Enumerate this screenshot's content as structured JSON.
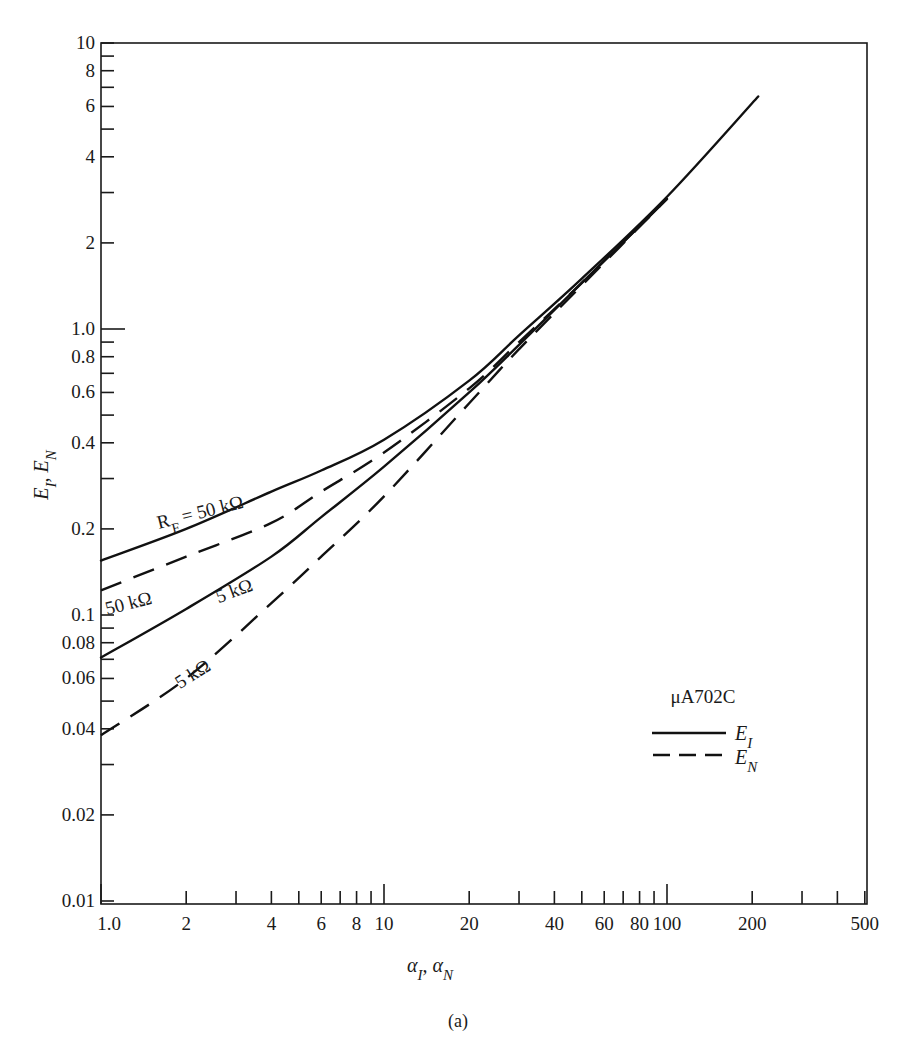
{
  "chart_data": {
    "type": "line",
    "title": "",
    "caption": "(a)",
    "xlabel": "α_I, α_N",
    "ylabel": "E_I, E_N",
    "xscale": "log",
    "yscale": "log",
    "xlim": [
      1.0,
      500
    ],
    "ylim": [
      0.01,
      10
    ],
    "grid": false,
    "legend_position": "lower-right inside plot",
    "legend_title": "μA702C",
    "legend": [
      {
        "label": "E_I",
        "style": "solid"
      },
      {
        "label": "E_N",
        "style": "dashed"
      }
    ],
    "x_ticks": {
      "labeled": [
        "1.0",
        "2",
        "4",
        "6",
        "8",
        "10",
        "20",
        "40",
        "60",
        "80",
        "100",
        "200",
        "500"
      ],
      "values": [
        1,
        2,
        3,
        4,
        5,
        6,
        7,
        8,
        9,
        10,
        20,
        30,
        40,
        50,
        60,
        70,
        80,
        90,
        100,
        200,
        300,
        400,
        500
      ]
    },
    "y_ticks": {
      "labeled": [
        "0.01",
        "0.02",
        "0.04",
        "0.06",
        "0.08",
        "0.1",
        "0.2",
        "0.4",
        "0.6",
        "0.8",
        "1.0",
        "2",
        "4",
        "6",
        "8",
        "10"
      ],
      "values": [
        0.01,
        0.02,
        0.03,
        0.04,
        0.05,
        0.06,
        0.07,
        0.08,
        0.09,
        0.1,
        0.2,
        0.3,
        0.4,
        0.5,
        0.6,
        0.7,
        0.8,
        0.9,
        1.0,
        2,
        3,
        4,
        5,
        6,
        7,
        8,
        9,
        10
      ]
    },
    "series": [
      {
        "name": "E_I, R_F = 50 kΩ",
        "style": "solid",
        "x": [
          1,
          2,
          4,
          6,
          10,
          20,
          30,
          50,
          100,
          210
        ],
        "y": [
          0.155,
          0.2,
          0.27,
          0.32,
          0.41,
          0.66,
          0.95,
          1.5,
          2.9,
          6.5
        ]
      },
      {
        "name": "E_N, R_F = 50 kΩ",
        "style": "dashed",
        "x": [
          1,
          2,
          4,
          6,
          10,
          20,
          30,
          50,
          100
        ],
        "y": [
          0.122,
          0.16,
          0.21,
          0.27,
          0.37,
          0.62,
          0.9,
          1.45,
          2.85
        ]
      },
      {
        "name": "E_I, R_F = 5 kΩ",
        "style": "solid",
        "x": [
          1,
          2,
          4,
          6,
          10,
          20,
          30,
          50,
          100
        ],
        "y": [
          0.071,
          0.105,
          0.16,
          0.22,
          0.33,
          0.6,
          0.88,
          1.45,
          2.85
        ]
      },
      {
        "name": "E_N, R_F = 5 kΩ",
        "style": "dashed",
        "x": [
          1,
          2,
          4,
          6,
          10,
          20,
          30,
          50,
          100
        ],
        "y": [
          0.038,
          0.06,
          0.11,
          0.16,
          0.26,
          0.55,
          0.85,
          1.42,
          2.85
        ]
      }
    ],
    "annotations": [
      {
        "text": "R_F = 50 kΩ",
        "near_series": 0,
        "x": 1.6,
        "y": 0.2,
        "rotate": -14
      },
      {
        "text": "50 kΩ",
        "near_series": 1,
        "x": 1.05,
        "y": 0.1,
        "rotate": -14
      },
      {
        "text": "5 kΩ",
        "near_series": 2,
        "x": 2.6,
        "y": 0.11,
        "rotate": -20
      },
      {
        "text": "5 kΩ",
        "near_series": 3,
        "x": 1.9,
        "y": 0.055,
        "rotate": -32
      }
    ]
  }
}
